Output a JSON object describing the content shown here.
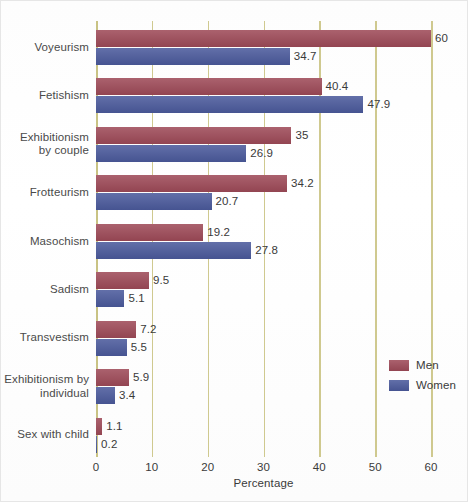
{
  "chart_data": {
    "type": "bar",
    "orientation": "horizontal",
    "title": "",
    "xlabel": "Percentage",
    "ylabel": "",
    "xlim": [
      0,
      60
    ],
    "xticks": [
      0,
      10,
      20,
      30,
      40,
      50,
      60
    ],
    "xticklabels": [
      "0",
      "10",
      "20",
      "30",
      "40",
      "50",
      "60"
    ],
    "grid": "vertical",
    "legend_position": "center-right",
    "categories": [
      "Voyeurism",
      "Fetishism",
      "Exhibitionism by couple",
      "Frotteurism",
      "Masochism",
      "Sadism",
      "Transvestism",
      "Exhibitionism by individual",
      "Sex with child"
    ],
    "category_lines": [
      [
        "Voyeurism"
      ],
      [
        "Fetishism"
      ],
      [
        "Exhibitionism",
        "by couple"
      ],
      [
        "Frotteurism"
      ],
      [
        "Masochism"
      ],
      [
        "Sadism"
      ],
      [
        "Transvestism"
      ],
      [
        "Exhibitionism by",
        "individual"
      ],
      [
        "Sex with child"
      ]
    ],
    "series": [
      {
        "name": "Men",
        "color": "#9e4a58",
        "values": [
          60,
          40.4,
          35,
          34.2,
          19.2,
          9.5,
          7.2,
          5.9,
          1.1
        ],
        "labels": [
          "60",
          "40.4",
          "35",
          "34.2",
          "19.2",
          "9.5",
          "7.2",
          "5.9",
          "1.1"
        ]
      },
      {
        "name": "Women",
        "color": "#4b5a9c",
        "values": [
          34.7,
          47.9,
          26.9,
          20.7,
          27.8,
          5.1,
          5.5,
          3.4,
          0.2
        ],
        "labels": [
          "34.7",
          "47.9",
          "26.9",
          "20.7",
          "27.8",
          "5.1",
          "5.5",
          "3.4",
          "0.2"
        ]
      }
    ]
  },
  "legend": {
    "men_label": "Men",
    "women_label": "Women"
  },
  "axis": {
    "x_title": "Percentage",
    "tick_0": "0",
    "tick_10": "10",
    "tick_20": "20",
    "tick_30": "30",
    "tick_40": "40",
    "tick_50": "50",
    "tick_60": "60"
  },
  "colors": {
    "men": "#9e4a58",
    "women": "#4b5a9c",
    "gridline": "#cfc98f",
    "text": "#3a3a3a",
    "background": "#ffffff"
  }
}
